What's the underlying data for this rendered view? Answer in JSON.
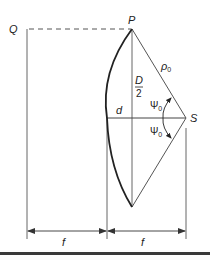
{
  "diagram": {
    "type": "geometric-optics-reflector",
    "colors": {
      "line": "#555555",
      "arc": "#222222",
      "text": "#222222",
      "rule": "#3a3a3a"
    },
    "points": {
      "Q": {
        "label": "Q"
      },
      "P": {
        "label": "P"
      },
      "S": {
        "label": "S"
      }
    },
    "labels": {
      "rho": "ρ",
      "rho_sub": "0",
      "half_aperture_num": "D",
      "half_aperture_den": "2",
      "depth": "d",
      "psi_upper": "Ψ",
      "psi_upper_sub": "0",
      "psi_lower": "Ψ",
      "psi_lower_sub": "0",
      "focal_left": "f",
      "focal_right": "f"
    }
  }
}
